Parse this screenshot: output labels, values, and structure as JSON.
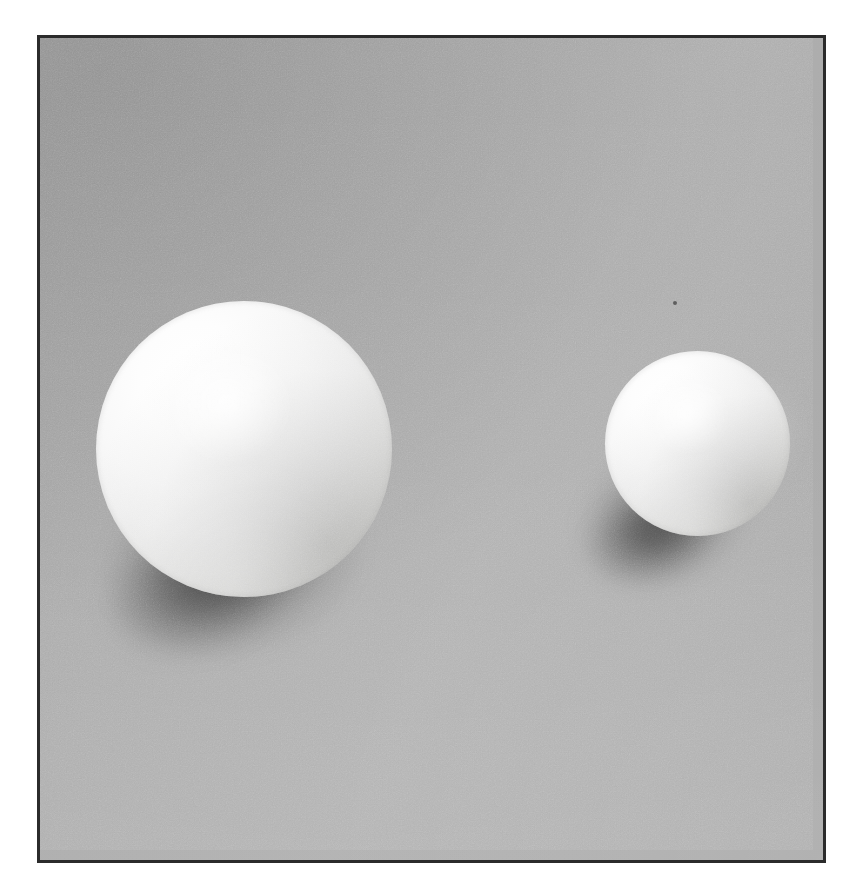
{
  "document": {
    "kind": "photograph",
    "subject": "two white spheres on a grey backdrop",
    "page_background": "#ffffff"
  },
  "frame": {
    "name": "photo-frame",
    "border_color": "#2b2b2b",
    "border_width_px": 3,
    "left_px": 37,
    "top_px": 35,
    "width_px": 789,
    "height_px": 828
  },
  "scene": {
    "backdrop_color": "#ababab",
    "backdrop_highlight": "#b0b0b0",
    "backdrop_shade": "#a3a3a3",
    "lighting_direction": "upper-right",
    "grain": "fine photographic film grain"
  },
  "objects": [
    {
      "id": "sphere-large",
      "label": "large white sphere",
      "center_x_px": 244,
      "center_y_px": 449,
      "diameter_px": 296,
      "body_color": "#f4f4f3",
      "highlight_color": "#ffffff",
      "shade_color": "#b0b0ae"
    },
    {
      "id": "sphere-small",
      "label": "small white sphere",
      "center_x_px": 697,
      "center_y_px": 443,
      "diameter_px": 185,
      "body_color": "#f4f4f3",
      "highlight_color": "#ffffff",
      "shade_color": "#b0b0ae"
    }
  ],
  "shadows": [
    {
      "id": "shadow-large",
      "label": "cast shadow of large sphere",
      "direction": "lower-left",
      "color": "rgba(0,0,0,0.42)"
    },
    {
      "id": "shadow-small",
      "label": "cast shadow of small sphere",
      "direction": "lower-left",
      "color": "rgba(0,0,0,0.40)"
    }
  ],
  "blemishes": [
    {
      "id": "dust-speck",
      "label": "dust speck on upper rim of small sphere",
      "x_px": 673,
      "y_px": 301,
      "color": "#4a4a4a"
    }
  ]
}
